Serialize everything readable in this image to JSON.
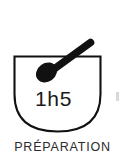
{
  "canvas": {
    "width": 125,
    "height": 155,
    "background_color": "#ffffff"
  },
  "icon_card": {
    "name": "preparation-time-icon-card",
    "duration_label": "1h5",
    "caption_label": "PRÉPARATION",
    "caption_clipped_at_bottom": true,
    "icon_semantic_name": "mixing-bowl-with-spoon-icon",
    "stroke_color": "#111111",
    "fill_color": "#111111",
    "duration_text_color": "#1a1a1a",
    "caption_text_color": "#2b2b2b",
    "parts": [
      {
        "name": "bowl-outline",
        "shape": "u-shaped-bowl",
        "stroke_width": 2
      },
      {
        "name": "spoon",
        "shape": "oval-head-with-angled-handle",
        "filled": true
      }
    ]
  },
  "artifact": {
    "name": "right-edge-artifact",
    "color": "#d8d8d8"
  }
}
